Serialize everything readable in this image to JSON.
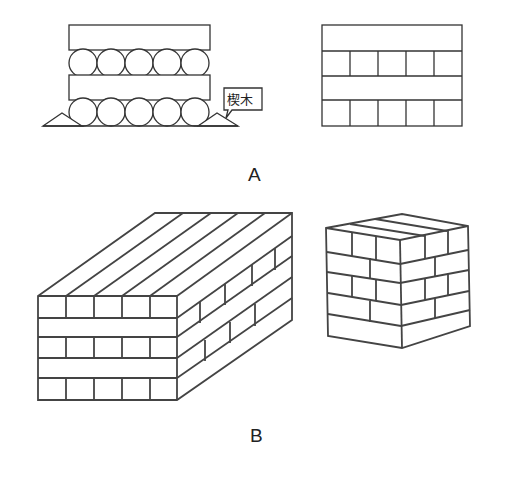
{
  "figure": {
    "panel_a": {
      "label": "A",
      "left_diagram": {
        "description": "Log-rolled stack: planks alternating with rows of round logs, wedges at the base",
        "plank_count": 2,
        "log_rows": 2,
        "logs_per_row": 5,
        "callout_label": "楔木"
      },
      "right_diagram": {
        "description": "Brick-pattern stack elevation",
        "plank_rows": 2,
        "block_rows": 2,
        "blocks_per_row": 5
      }
    },
    "panel_b": {
      "label": "B",
      "left_drawing": "Large rectangular stack of blocks in perspective",
      "right_drawing": "Cubic stack of blocks in perspective"
    },
    "caption": ""
  }
}
